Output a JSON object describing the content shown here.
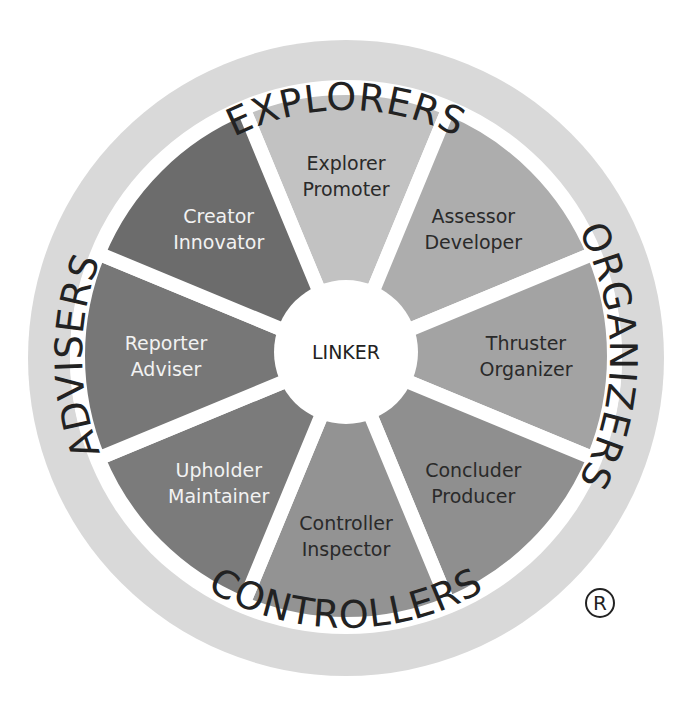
{
  "diagram": {
    "center": {
      "label": "LINKER"
    },
    "ring_labels": [
      {
        "id": "explorers",
        "label": "EXPLORERS"
      },
      {
        "id": "organizers",
        "label": "ORGANIZERS"
      },
      {
        "id": "controllers",
        "label": "CONTROLLERS"
      },
      {
        "id": "advisers",
        "label": "ADVISERS"
      }
    ],
    "segments": [
      {
        "line1": "Explorer",
        "line2": "Promoter",
        "color": "#c2c2c2",
        "text_color": "#2a2a2a"
      },
      {
        "line1": "Assessor",
        "line2": "Developer",
        "color": "#adadad",
        "text_color": "#2a2a2a"
      },
      {
        "line1": "Thruster",
        "line2": "Organizer",
        "color": "#a3a3a3",
        "text_color": "#2a2a2a"
      },
      {
        "line1": "Concluder",
        "line2": "Producer",
        "color": "#8f8f8f",
        "text_color": "#2a2a2a"
      },
      {
        "line1": "Controller",
        "line2": "Inspector",
        "color": "#939393",
        "text_color": "#2a2a2a"
      },
      {
        "line1": "Upholder",
        "line2": "Maintainer",
        "color": "#7b7b7b",
        "text_color": "#f2f2f2"
      },
      {
        "line1": "Reporter",
        "line2": "Adviser",
        "color": "#777777",
        "text_color": "#f2f2f2"
      },
      {
        "line1": "Creator",
        "line2": "Innovator",
        "color": "#6c6c6c",
        "text_color": "#f2f2f2"
      }
    ],
    "ring_color": "#d9d9d9",
    "registered_mark": "®"
  }
}
